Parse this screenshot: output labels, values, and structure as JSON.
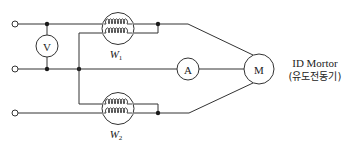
{
  "diagram": {
    "meters": {
      "voltmeter": {
        "symbol": "V"
      },
      "ammeter": {
        "symbol": "A"
      },
      "motor": {
        "symbol": "M"
      }
    },
    "wattmeters": [
      {
        "id": "W1",
        "letter": "W",
        "subscript": "1"
      },
      {
        "id": "W2",
        "letter": "W",
        "subscript": "2"
      }
    ],
    "motor_label": {
      "line1": "ID Mortor",
      "line2": "(유도전동기)"
    },
    "terminals": [
      "line-1",
      "line-2",
      "line-3"
    ],
    "colors": {
      "line": "#333333",
      "background": "#ffffff"
    }
  }
}
